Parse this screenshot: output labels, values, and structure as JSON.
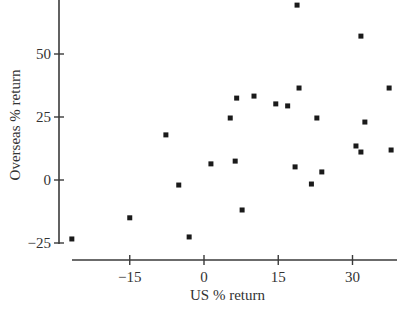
{
  "chart_data": {
    "type": "scatter",
    "title": "",
    "xlabel": "US % return",
    "ylabel": "Overseas % return",
    "xticks": [
      -15,
      0,
      15,
      30
    ],
    "yticks": [
      -25,
      0,
      25,
      50
    ],
    "xlim": [
      -27,
      39
    ],
    "ylim": [
      -25,
      72
    ],
    "grid": false,
    "legend": null,
    "marker": "square",
    "points": [
      {
        "x": -26.7,
        "y": -23.4
      },
      {
        "x": -15.0,
        "y": -15.0
      },
      {
        "x": -7.7,
        "y": 17.9
      },
      {
        "x": -5.1,
        "y": -2.0
      },
      {
        "x": -3.0,
        "y": -22.6
      },
      {
        "x": 1.4,
        "y": 6.4
      },
      {
        "x": 5.3,
        "y": 24.6
      },
      {
        "x": 6.3,
        "y": 7.5
      },
      {
        "x": 6.6,
        "y": 32.5
      },
      {
        "x": 7.7,
        "y": -11.9
      },
      {
        "x": 10.1,
        "y": 33.3
      },
      {
        "x": 14.5,
        "y": 30.2
      },
      {
        "x": 16.9,
        "y": 29.4
      },
      {
        "x": 18.4,
        "y": 5.2
      },
      {
        "x": 18.8,
        "y": 69.4
      },
      {
        "x": 19.2,
        "y": 36.5
      },
      {
        "x": 21.7,
        "y": -1.6
      },
      {
        "x": 22.8,
        "y": 24.6
      },
      {
        "x": 23.8,
        "y": 3.2
      },
      {
        "x": 30.7,
        "y": 13.5
      },
      {
        "x": 31.7,
        "y": 57.1
      },
      {
        "x": 31.7,
        "y": 11.1
      },
      {
        "x": 32.5,
        "y": 23.0
      },
      {
        "x": 37.4,
        "y": 36.5
      },
      {
        "x": 37.8,
        "y": 11.9
      }
    ]
  },
  "layout": {
    "x_origin_px": 204,
    "x_px_per_unit": 4.95,
    "y_origin_px": 180,
    "y_px_per_unit": 2.52,
    "y_axis_x_px": 59,
    "y_axis_top_px": 0,
    "y_axis_bottom_px": 244,
    "x_axis_y_px": 260,
    "x_axis_left_px": 72,
    "x_axis_right_px": 397,
    "marker_size_px": 5,
    "colors": {
      "axis": "#3a3a3a",
      "marker": "#1a1a1a",
      "text": "#333333",
      "background": "#ffffff"
    }
  }
}
